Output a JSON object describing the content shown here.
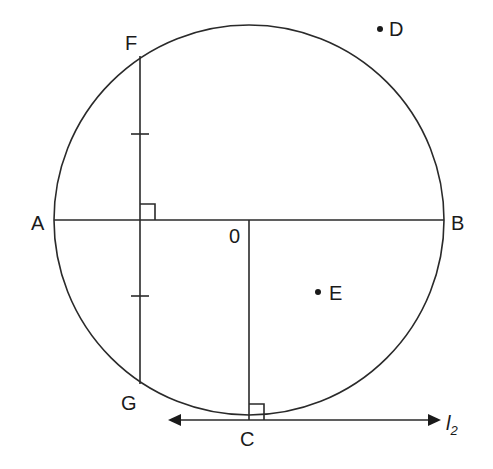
{
  "diagram": {
    "circle": {
      "cx": 249,
      "cy": 220,
      "r": 195
    },
    "labels": {
      "A": "A",
      "B": "B",
      "C": "C",
      "D": "D",
      "E": "E",
      "F": "F",
      "G": "G",
      "O": "0",
      "l2_main": "l",
      "l2_sub": "2"
    },
    "segments": [
      {
        "name": "diameter-AB",
        "from": "A",
        "to": "B"
      },
      {
        "name": "chord-FG",
        "from": "F",
        "to": "G",
        "tick_marks": 2
      },
      {
        "name": "radius-OC",
        "from": "O",
        "to": "C"
      },
      {
        "name": "tangent-l2",
        "through": "C",
        "arrows": "both"
      }
    ],
    "right_angles": [
      "FG ⟂ AB",
      "OC ⟂ l2"
    ],
    "points_outside": [
      "D"
    ],
    "points_inside": [
      "E"
    ]
  }
}
